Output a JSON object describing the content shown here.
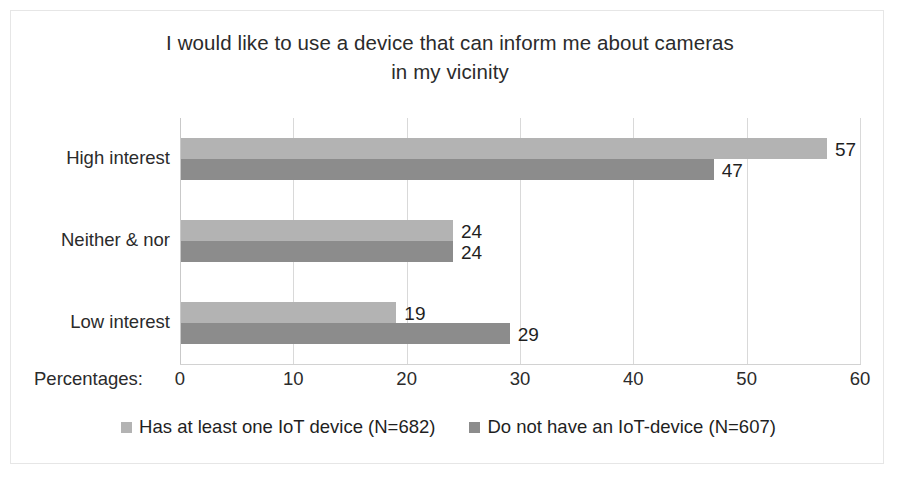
{
  "chart_data": {
    "type": "bar",
    "orientation": "horizontal",
    "title": "I would like to use a device that can inform me about cameras in my vicinity",
    "title_lines": [
      "I would like to use a device that can inform me about cameras",
      "in my vicinity"
    ],
    "categories": [
      "High interest",
      "Neither & nor",
      "Low interest"
    ],
    "series": [
      {
        "name": "Has at least one IoT device (N=682)",
        "values": [
          57,
          24,
          19
        ],
        "color": "#b3b3b3"
      },
      {
        "name": "Do not have an IoT-device (N=607)",
        "values": [
          47,
          24,
          29
        ],
        "color": "#8c8c8c"
      }
    ],
    "xlabel": "Percentages:",
    "ylabel": "",
    "xlim": [
      0,
      60
    ],
    "xticks": [
      0,
      10,
      20,
      30,
      40,
      50,
      60
    ],
    "xtick_labels": [
      "0",
      "10",
      "20",
      "30",
      "40",
      "50",
      "60"
    ],
    "grid": true,
    "grid_axis": "x",
    "legend_position": "bottom",
    "data_labels": true,
    "background_color": "#ffffff",
    "border_color": "#e6e6e6",
    "text_color": "#2b2b2b"
  }
}
